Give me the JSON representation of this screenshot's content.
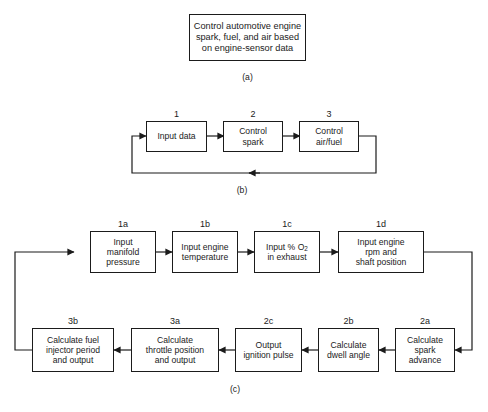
{
  "figure": {
    "title_text": "Control automotive engine spark, fuel, and air based on engine-sensor data",
    "parts": [
      {
        "id": "a",
        "caption": "(a)"
      },
      {
        "id": "b",
        "caption": "(b)"
      },
      {
        "id": "c",
        "caption": "(c)"
      }
    ]
  },
  "part_a": {
    "caption": "(a)",
    "box": {
      "tag": "",
      "text": "Control automotive engine\nspark, fuel, and air based\non engine-sensor data"
    }
  },
  "part_b": {
    "caption": "(b)",
    "boxes": [
      {
        "tag": "1",
        "text": "Input data"
      },
      {
        "tag": "2",
        "text": "Control\nspark"
      },
      {
        "tag": "3",
        "text": "Control\nair/fuel"
      }
    ]
  },
  "part_c": {
    "caption": "(c)",
    "top_row": [
      {
        "tag": "1a",
        "text": "Input\nmanifold\npressure"
      },
      {
        "tag": "1b",
        "text": "Input engine\ntemperature"
      },
      {
        "tag": "1c",
        "text": "Input % O",
        "text_sub": "2",
        "text_after": "\nin exhaust"
      },
      {
        "tag": "1d",
        "text": "Input engine\nrpm and\nshaft position"
      }
    ],
    "bottom_row": [
      {
        "tag": "3b",
        "text": "Calculate fuel\ninjector period\nand output"
      },
      {
        "tag": "3a",
        "text": "Calculate\nthrottle position\nand output"
      },
      {
        "tag": "2c",
        "text": "Output\nignition pulse"
      },
      {
        "tag": "2b",
        "text": "Calculate\ndwell angle"
      },
      {
        "tag": "2a",
        "text": "Calculate\nspark advance"
      }
    ]
  },
  "style": {
    "line_color": "#1b1b1b",
    "box_fill": "#ffffff",
    "page_background": "#ffffff"
  }
}
